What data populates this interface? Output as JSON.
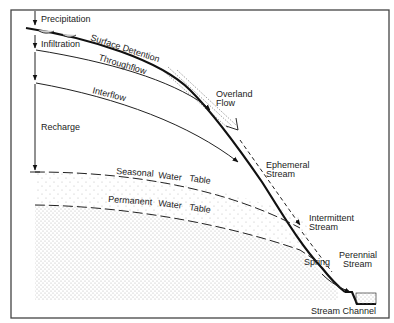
{
  "labels": {
    "precipitation": "Precipitation",
    "infiltration": "Infiltration",
    "surface_detention": "Surface Detention",
    "throughflow": "Throughflow",
    "interflow": "Interflow",
    "recharge": "Recharge",
    "overland_flow_1": "Overland",
    "overland_flow_2": "Flow",
    "ephemeral_stream_1": "Ephemeral",
    "ephemeral_stream_2": "Stream",
    "seasonal_water_table": [
      "Seasonal",
      "Water",
      "Table"
    ],
    "permanent_water_table": [
      "Permanent",
      "Water",
      "Table"
    ],
    "intermittent_stream_1": "Intermittent",
    "intermittent_stream_2": "Stream",
    "spring": "Spring",
    "perennial_stream_1": "Perennial",
    "perennial_stream_2": "Stream",
    "stream_channel": "Stream Channel"
  },
  "colors": {
    "line": "#111111",
    "stipple": "#b5b5b5",
    "frame": "#444444"
  }
}
